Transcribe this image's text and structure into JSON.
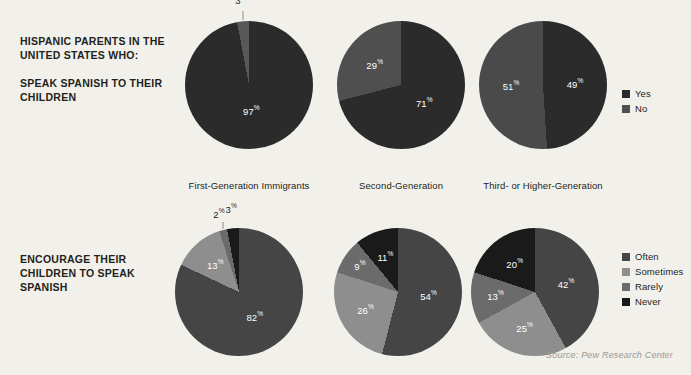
{
  "background_color": "#f2f0ea",
  "source": {
    "text": "Source: Pew Research Center"
  },
  "rows": [
    {
      "id": "speak-spanish",
      "heading_lead": "HISPANIC PARENTS IN THE UNITED STATES WHO:",
      "heading_sub": "SPEAK SPANISH TO THEIR CHILDREN",
      "legend": [
        {
          "label": "Yes",
          "color": "#2b2b2b"
        },
        {
          "label": "No",
          "color": "#4f4f4f"
        }
      ],
      "categories": [
        "First-Generation Immigrants",
        "Second-Generation",
        "Third- or Higher-Generation"
      ],
      "charts": [
        {
          "category": "First-Generation Immigrants",
          "slices": [
            {
              "label": "Yes",
              "value": 97,
              "display": "97",
              "color": "#2b2b2b"
            },
            {
              "label": "No",
              "value": 3,
              "display": "3",
              "color": "#585858"
            }
          ]
        },
        {
          "category": "Second-Generation",
          "slices": [
            {
              "label": "Yes",
              "value": 71,
              "display": "71",
              "color": "#2b2b2b"
            },
            {
              "label": "No",
              "value": 29,
              "display": "29",
              "color": "#4f4f4f"
            }
          ]
        },
        {
          "category": "Third- or Higher-Generation",
          "slices": [
            {
              "label": "Yes",
              "value": 49,
              "display": "49",
              "color": "#2b2b2b"
            },
            {
              "label": "No",
              "value": 51,
              "display": "51",
              "color": "#4a4a4a"
            }
          ]
        }
      ]
    },
    {
      "id": "encourage-spanish",
      "heading_lead": "ENCOURAGE THEIR CHILDREN TO SPEAK SPANISH",
      "heading_sub": "",
      "legend": [
        {
          "label": "Often",
          "color": "#454545"
        },
        {
          "label": "Sometimes",
          "color": "#8e8e8e"
        },
        {
          "label": "Rarely",
          "color": "#6b6b6b"
        },
        {
          "label": "Never",
          "color": "#1a1a1a"
        }
      ],
      "charts": [
        {
          "category": "First-Generation Immigrants",
          "slices": [
            {
              "label": "Often",
              "value": 82,
              "display": "82",
              "color": "#454545"
            },
            {
              "label": "Sometimes",
              "value": 13,
              "display": "13",
              "color": "#8e8e8e"
            },
            {
              "label": "Rarely",
              "value": 2,
              "display": "2",
              "color": "#6b6b6b"
            },
            {
              "label": "Never",
              "value": 3,
              "display": "3",
              "color": "#1a1a1a"
            }
          ]
        },
        {
          "category": "Second-Generation",
          "slices": [
            {
              "label": "Often",
              "value": 54,
              "display": "54",
              "color": "#454545"
            },
            {
              "label": "Sometimes",
              "value": 26,
              "display": "26",
              "color": "#8e8e8e"
            },
            {
              "label": "Rarely",
              "value": 9,
              "display": "9",
              "color": "#6b6b6b"
            },
            {
              "label": "Never",
              "value": 11,
              "display": "11",
              "color": "#1a1a1a"
            }
          ]
        },
        {
          "category": "Third- or Higher-Generation",
          "slices": [
            {
              "label": "Often",
              "value": 42,
              "display": "42",
              "color": "#454545"
            },
            {
              "label": "Sometimes",
              "value": 25,
              "display": "25",
              "color": "#8e8e8e"
            },
            {
              "label": "Rarely",
              "value": 13,
              "display": "13",
              "color": "#6b6b6b"
            },
            {
              "label": "Never",
              "value": 20,
              "display": "20",
              "color": "#1a1a1a"
            }
          ]
        }
      ]
    }
  ],
  "chart_data": [
    {
      "type": "pie",
      "title": "Hispanic parents in the United States who speak Spanish to their children",
      "legend_position": "right",
      "legend": [
        "Yes",
        "No"
      ],
      "series": [
        {
          "name": "First-Generation Immigrants",
          "categories": [
            "Yes",
            "No"
          ],
          "values": [
            97,
            3
          ]
        },
        {
          "name": "Second-Generation",
          "categories": [
            "Yes",
            "No"
          ],
          "values": [
            71,
            29
          ]
        },
        {
          "name": "Third- or Higher-Generation",
          "categories": [
            "Yes",
            "No"
          ],
          "values": [
            49,
            51
          ]
        }
      ],
      "units": "percent"
    },
    {
      "type": "pie",
      "title": "Hispanic parents in the United States who encourage their children to speak Spanish",
      "legend_position": "right",
      "legend": [
        "Often",
        "Sometimes",
        "Rarely",
        "Never"
      ],
      "series": [
        {
          "name": "First-Generation Immigrants",
          "categories": [
            "Often",
            "Sometimes",
            "Rarely",
            "Never"
          ],
          "values": [
            82,
            13,
            2,
            3
          ]
        },
        {
          "name": "Second-Generation",
          "categories": [
            "Often",
            "Sometimes",
            "Rarely",
            "Never"
          ],
          "values": [
            54,
            26,
            9,
            11
          ]
        },
        {
          "name": "Third- or Higher-Generation",
          "categories": [
            "Often",
            "Sometimes",
            "Rarely",
            "Never"
          ],
          "values": [
            42,
            25,
            13,
            20
          ]
        }
      ],
      "units": "percent"
    }
  ]
}
